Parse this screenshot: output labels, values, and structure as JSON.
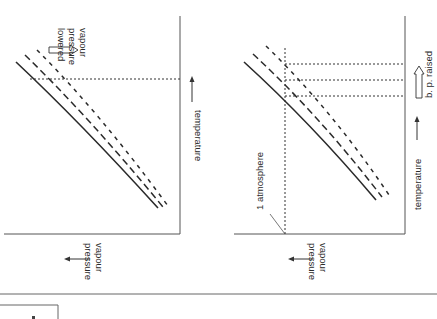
{
  "left_diagram": {
    "title": "vapour pressure lowered",
    "annotation_lines": [
      "vapour",
      "pressure",
      "lowered"
    ],
    "x_axis_label": "temperature",
    "y_axis_label_lines": [
      "vapour",
      "pressure"
    ],
    "curves": [
      {
        "name": "pure solvent",
        "style": "solid"
      },
      {
        "name": "dilute solution",
        "style": "long-dash"
      },
      {
        "name": "concentrated solution",
        "style": "short-dash"
      }
    ]
  },
  "right_diagram": {
    "title": "b. p. raised",
    "annotation": "b. p. raised",
    "reference_line_label": "1 atmosphere",
    "x_axis_label": "temperature",
    "y_axis_label_lines": [
      "vapour",
      "pressure"
    ],
    "curves": [
      {
        "name": "pure solvent",
        "style": "solid"
      },
      {
        "name": "dilute solution",
        "style": "long-dash"
      },
      {
        "name": "concentrated solution",
        "style": "short-dash"
      }
    ]
  },
  "colors": {
    "ink": "#2a2a2a",
    "axis": "#555555",
    "background": "#ffffff"
  }
}
